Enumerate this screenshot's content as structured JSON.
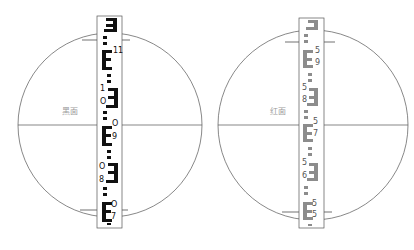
{
  "panels": [
    {
      "id": "black",
      "label": "黑面",
      "face": "black face",
      "color": "#111111",
      "circle": {
        "cx": 110,
        "cy": 125,
        "r": 92
      },
      "staff": {
        "x": 97,
        "y": 16,
        "w": 25,
        "h": 212
      },
      "crosshair_y": 125,
      "stadia_top_y": 40,
      "stadia_bottom_y": 210,
      "numbers": [
        {
          "text": "11",
          "x": 113,
          "y": 50
        },
        {
          "text": "1",
          "x": 100,
          "y": 87
        },
        {
          "text": "O",
          "x": 100,
          "y": 100
        },
        {
          "text": "O",
          "x": 112,
          "y": 123
        },
        {
          "text": "9",
          "x": 112,
          "y": 135
        },
        {
          "text": "O",
          "x": 99,
          "y": 165
        },
        {
          "text": "8",
          "x": 99,
          "y": 178
        },
        {
          "text": "O",
          "x": 111,
          "y": 203
        },
        {
          "text": "7",
          "x": 111,
          "y": 215
        }
      ]
    },
    {
      "id": "red",
      "label": "红面",
      "face": "red face",
      "color": "#8c8c8c",
      "circle": {
        "cx": 313,
        "cy": 125,
        "r": 95
      },
      "staff": {
        "x": 299,
        "y": 18,
        "w": 25,
        "h": 210
      },
      "crosshair_y": 125,
      "stadia_top_y": 42,
      "stadia_bottom_y": 212,
      "numbers": [
        {
          "text": "5",
          "x": 315,
          "y": 47
        },
        {
          "text": "9",
          "x": 315,
          "y": 60
        },
        {
          "text": "5",
          "x": 302,
          "y": 84
        },
        {
          "text": "8",
          "x": 302,
          "y": 97
        },
        {
          "text": "5",
          "x": 313,
          "y": 120
        },
        {
          "text": "7",
          "x": 313,
          "y": 132
        },
        {
          "text": "5",
          "x": 302,
          "y": 160
        },
        {
          "text": "6",
          "x": 302,
          "y": 173
        },
        {
          "text": "5",
          "x": 312,
          "y": 200
        },
        {
          "text": "5",
          "x": 312,
          "y": 212
        }
      ]
    }
  ]
}
